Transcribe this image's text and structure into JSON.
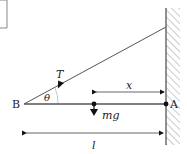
{
  "diagram": {
    "type": "physics-free-body",
    "colors": {
      "line": "#555555",
      "arrow": "#111111",
      "hatch": "#9a9a9a",
      "text": "#222222"
    },
    "labels": {
      "end_b": "B",
      "end_a": "A",
      "tension": "T",
      "angle": "θ",
      "weight": "mg",
      "distance_x": "x",
      "length": "l"
    }
  }
}
